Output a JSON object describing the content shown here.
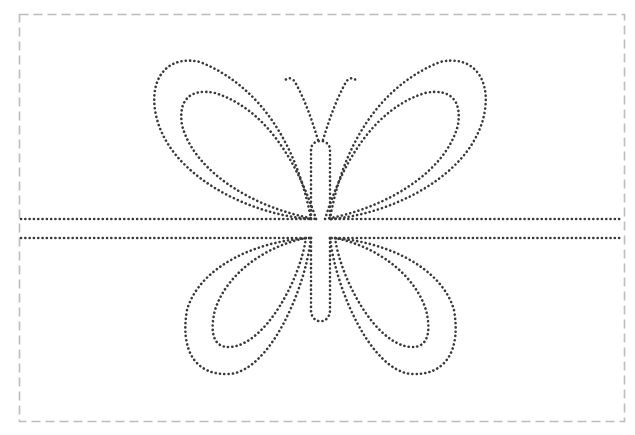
{
  "worksheet": {
    "title": "Butterfly dot-to-dot tracing worksheet",
    "subject": "butterfly",
    "colors": {
      "background": "#ffffff",
      "border": "#bdbdbd",
      "trace_dots": "#3a3a3a"
    },
    "border_style": "dashed",
    "trace_style": "dotted",
    "guide_lines": [
      {
        "label": "upper guide line",
        "y": 219
      },
      {
        "label": "lower guide line",
        "y": 238
      }
    ],
    "parts": [
      {
        "label": "left upper wing outer"
      },
      {
        "label": "left upper wing inner"
      },
      {
        "label": "right upper wing outer"
      },
      {
        "label": "right upper wing inner"
      },
      {
        "label": "left lower wing outer"
      },
      {
        "label": "left lower wing inner"
      },
      {
        "label": "right lower wing outer"
      },
      {
        "label": "right lower wing inner"
      },
      {
        "label": "body"
      },
      {
        "label": "left antenna"
      },
      {
        "label": "right antenna"
      }
    ]
  }
}
